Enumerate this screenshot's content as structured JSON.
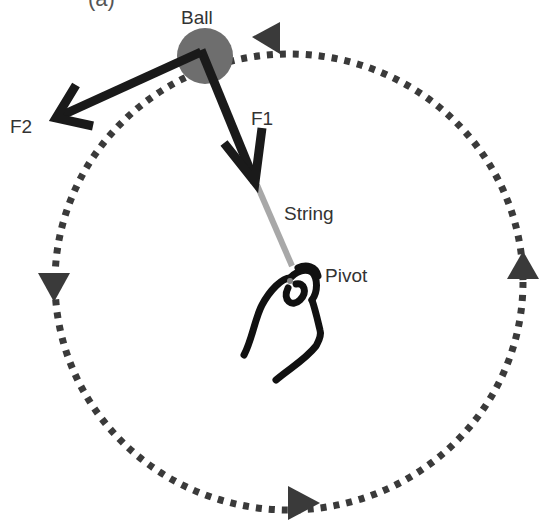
{
  "diagram": {
    "caption_fragment": "(a)",
    "labels": {
      "ball": "Ball",
      "f1": "F1",
      "f2": "F2",
      "string": "String",
      "pivot": "Pivot"
    },
    "orbit_direction": "counter-clockwise",
    "colors": {
      "ball": "#6e6e6e",
      "arrows": "#1a1a1a",
      "orbit": "#3a3a3a",
      "string": "#a8a8a8",
      "hand": "#111111",
      "text": "#333333"
    }
  }
}
